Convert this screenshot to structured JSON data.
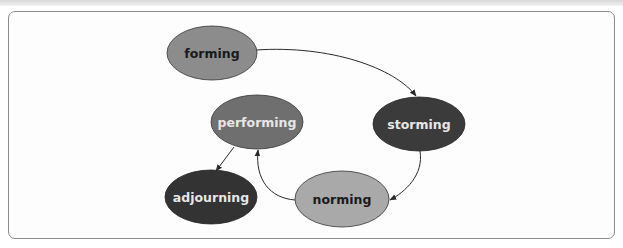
{
  "diagram": {
    "type": "cycle",
    "nodes": [
      {
        "id": "forming",
        "label": "forming",
        "fill": "#8c8c8c",
        "text_color": "#1a1a1a"
      },
      {
        "id": "storming",
        "label": "storming",
        "fill": "#3b3b3b",
        "text_color": "#e6e6e6"
      },
      {
        "id": "norming",
        "label": "norming",
        "fill": "#a9a9a9",
        "text_color": "#1a1a1a"
      },
      {
        "id": "performing",
        "label": "performing",
        "fill": "#6f6f6f",
        "text_color": "#e6e6e6"
      },
      {
        "id": "adjourning",
        "label": "adjourning",
        "fill": "#333333",
        "text_color": "#e6e6e6"
      }
    ],
    "edges": [
      {
        "from": "forming",
        "to": "storming"
      },
      {
        "from": "storming",
        "to": "norming"
      },
      {
        "from": "norming",
        "to": "performing"
      },
      {
        "from": "performing",
        "to": "adjourning"
      }
    ],
    "colors": {
      "frame_border": "#8c8c8c",
      "edge": "#2a2a2a",
      "background": "#fdfdfd"
    }
  }
}
